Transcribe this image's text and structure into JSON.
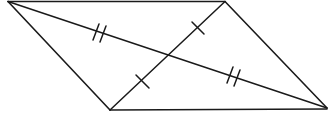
{
  "diagram": {
    "type": "parallelogram-with-diagonals",
    "colors": {
      "stroke": "#1a1a1a",
      "background": "#ffffff"
    },
    "vertices": {
      "top_left": [
        8,
        1
      ],
      "top_right": [
        225,
        1
      ],
      "bottom_right": [
        327,
        108
      ],
      "bottom_left": [
        110,
        110
      ]
    },
    "intersection": [
      170,
      55
    ],
    "diagonals": [
      {
        "name": "long-diagonal",
        "from": "top_left",
        "to": "bottom_right",
        "tick_marks": 2
      },
      {
        "name": "short-diagonal",
        "from": "bottom_left",
        "to": "top_right",
        "tick_marks": 1
      }
    ],
    "annotations": [
      "Double tick marks show the two halves of the long diagonal are congruent",
      "Single tick marks show the two halves of the short diagonal are congruent"
    ]
  }
}
